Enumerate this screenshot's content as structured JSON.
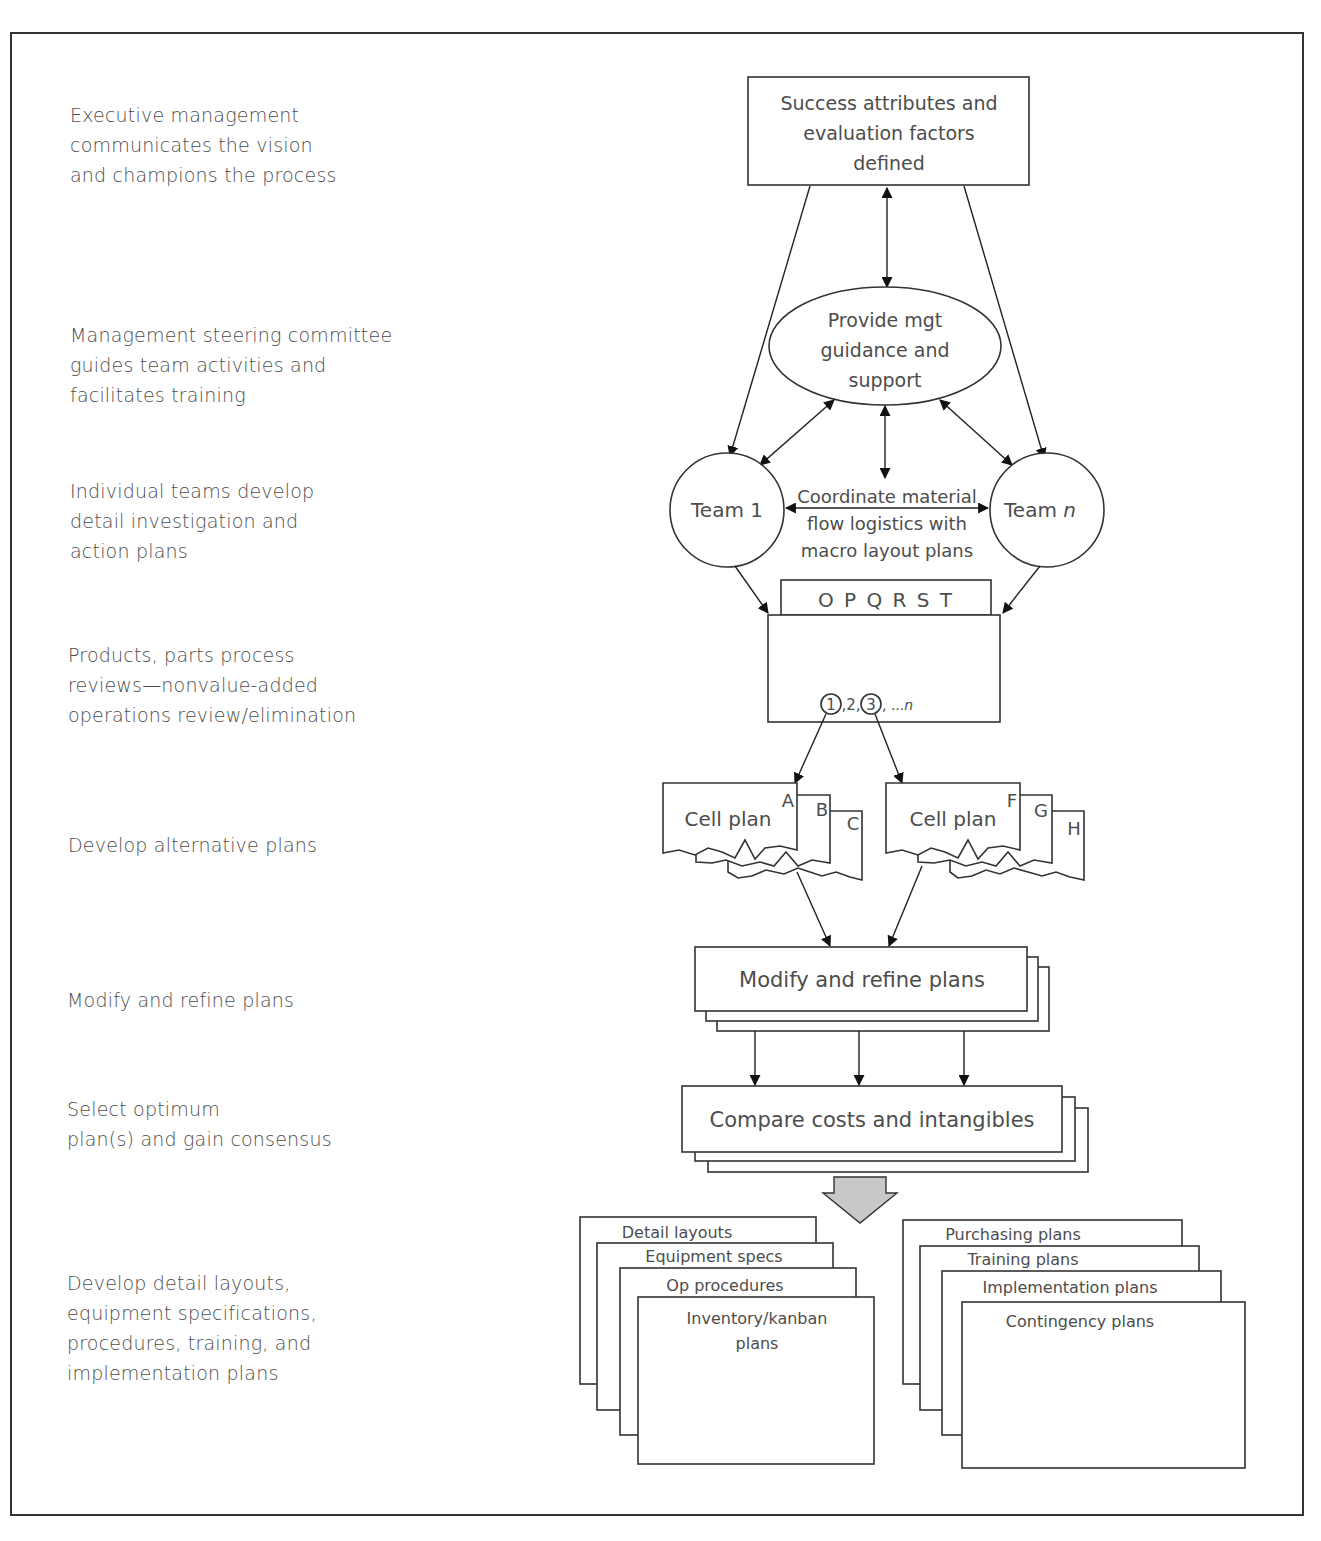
{
  "steps": [
    {
      "lines": [
        "Executive management",
        "communicates the vision",
        "and champions the process"
      ]
    },
    {
      "lines": [
        "Management steering committee",
        "guides team activities and",
        "facilitates training"
      ]
    },
    {
      "lines": [
        "Individual teams develop",
        "detail investigation and",
        "action plans"
      ]
    },
    {
      "lines": [
        "Products, parts process",
        "reviews—nonvalue-added",
        "operations review/elimination"
      ]
    },
    {
      "lines": [
        "Develop alternative plans"
      ]
    },
    {
      "lines": [
        "Modify and refine plans"
      ]
    },
    {
      "lines": [
        "Select optimum",
        "plan(s) and gain consensus"
      ]
    },
    {
      "lines": [
        "Develop detail layouts,",
        "equipment specifications,",
        "procedures, training, and",
        "implementation plans"
      ]
    }
  ],
  "diagram": {
    "success_box": {
      "lines": [
        "Success attributes and",
        "evaluation factors",
        "defined"
      ]
    },
    "guidance_ellipse": {
      "lines": [
        "Provide mgt",
        "guidance and",
        "support"
      ]
    },
    "team_left": {
      "label": "Team 1"
    },
    "team_right": {
      "label": "Team",
      "suffix": "n"
    },
    "coordinate_note": {
      "lines": [
        "Coordinate material",
        "flow logistics with",
        "macro layout plans"
      ]
    },
    "product_tab": {
      "label": "O P Q R S T"
    },
    "product_numbers": {
      "n1": "1",
      "sep1": ",2,",
      "n3": "3",
      "rest": ", ...",
      "n": "n"
    },
    "cell_plans_left": {
      "label": "Cell plan",
      "letters": [
        "A",
        "B",
        "C"
      ]
    },
    "cell_plans_right": {
      "label": "Cell plan",
      "letters": [
        "F",
        "G",
        "H"
      ]
    },
    "modify_box": {
      "label": "Modify and refine plans"
    },
    "compare_box": {
      "label": "Compare costs and intangibles"
    },
    "docs_left": [
      "Detail layouts",
      "Equipment specs",
      "Op procedures",
      "Inventory/kanban",
      "plans"
    ],
    "docs_right": [
      "Purchasing plans",
      "Training plans",
      "Implementation plans",
      "Contingency plans"
    ]
  },
  "colors": {
    "line": "#222222",
    "text": "#4d4d4d",
    "big_arrow_fill": "#c8c8c8"
  }
}
